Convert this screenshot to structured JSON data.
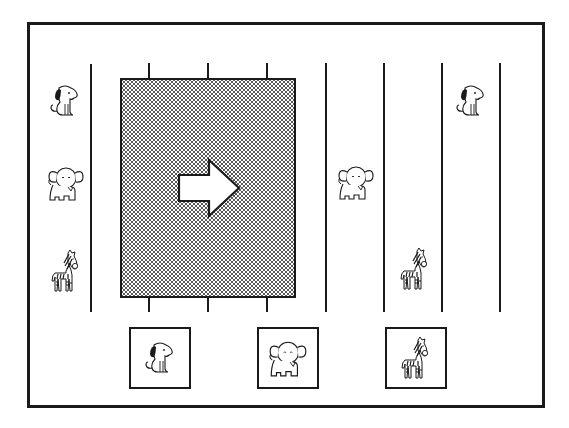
{
  "diagram": {
    "colors": {
      "ink": "#1a1a1a",
      "background": "#ffffff",
      "stipple": "#5a5a5a"
    },
    "left_column": [
      {
        "animal": "dog",
        "icon": "dog-icon"
      },
      {
        "animal": "elephant",
        "icon": "elephant-icon"
      },
      {
        "animal": "zebra",
        "icon": "zebra-icon"
      }
    ],
    "hidden_region": {
      "label": "shaded-box",
      "arrow": "arrow-right-icon",
      "hidden_lanes": 3
    },
    "right_lanes": [
      {
        "lane": 1,
        "animal": "elephant",
        "row": 2
      },
      {
        "lane": 2,
        "animal": "zebra",
        "row": 3
      },
      {
        "lane": 3,
        "animal": "dog",
        "row": 1
      },
      {
        "lane": 4,
        "animal": null
      }
    ],
    "choices": [
      {
        "animal": "dog",
        "icon": "dog-icon"
      },
      {
        "animal": "elephant",
        "icon": "elephant-icon"
      },
      {
        "animal": "zebra",
        "icon": "zebra-icon"
      }
    ]
  }
}
